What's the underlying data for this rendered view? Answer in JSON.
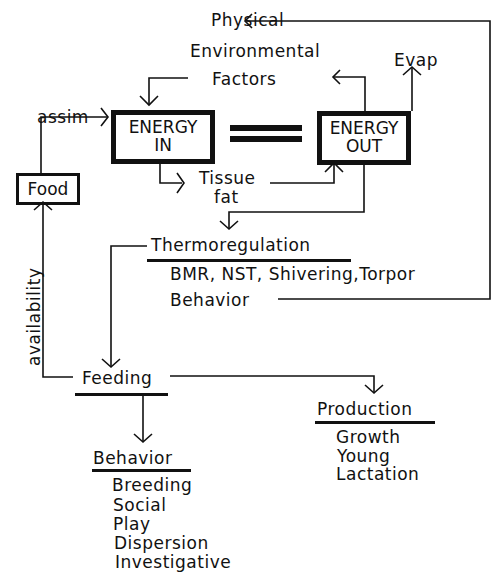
{
  "diagram": {
    "factors": {
      "line1": "Physical",
      "line2": "Environmental",
      "line3": "Factors"
    },
    "evap": "Evap",
    "assim": "assim",
    "food": "Food",
    "energy_in": {
      "line1": "ENERGY",
      "line2": "IN"
    },
    "energy_out": {
      "line1": "ENERGY",
      "line2": "OUT"
    },
    "equals": "=",
    "tissue": {
      "line1": "Tissue",
      "line2": "fat"
    },
    "availability": "availability",
    "thermoregulation": {
      "title": "Thermoregulation",
      "items": [
        "BMR, NST, Shivering,Torpor",
        "Behavior"
      ]
    },
    "feeding": {
      "title": "Feeding"
    },
    "production": {
      "title": "Production",
      "items": [
        "Growth",
        "Young",
        "Lactation"
      ]
    },
    "behavior": {
      "title": "Behavior",
      "items": [
        "Breeding",
        "Social",
        "Play",
        "Dispersion",
        "Investigative"
      ]
    }
  }
}
